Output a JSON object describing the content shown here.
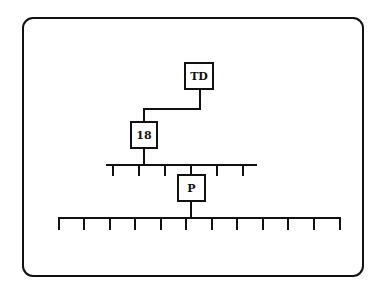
{
  "diagram": {
    "type": "hierarchy",
    "colors": {
      "stroke": "#111111",
      "background": "#ffffff"
    },
    "nodes": [
      {
        "id": "td",
        "label": "TD",
        "x": 184,
        "y": 62,
        "w": 30,
        "h": 28
      },
      {
        "id": "n18",
        "label": "18",
        "x": 130,
        "y": 121,
        "w": 28,
        "h": 28
      },
      {
        "id": "p",
        "label": "P",
        "x": 177,
        "y": 174,
        "w": 29,
        "h": 28
      }
    ],
    "edges": [
      {
        "from": "TD",
        "to": "18"
      },
      {
        "from": "18",
        "to": "upper-bus"
      },
      {
        "from": "upper-bus",
        "to": "P"
      },
      {
        "from": "P",
        "to": "lower-bus"
      }
    ],
    "buses": [
      {
        "id": "upper-bus",
        "y": 165,
        "x1": 106,
        "x2": 257,
        "tick_count": 6,
        "ticks": [
          113,
          139,
          165,
          217,
          243
        ]
      },
      {
        "id": "lower-bus",
        "y": 218,
        "x1": 59,
        "x2": 341,
        "tick_count": 12,
        "ticks": [
          59,
          84,
          110,
          135,
          161,
          186,
          212,
          237,
          263,
          288,
          314,
          339
        ]
      }
    ]
  }
}
